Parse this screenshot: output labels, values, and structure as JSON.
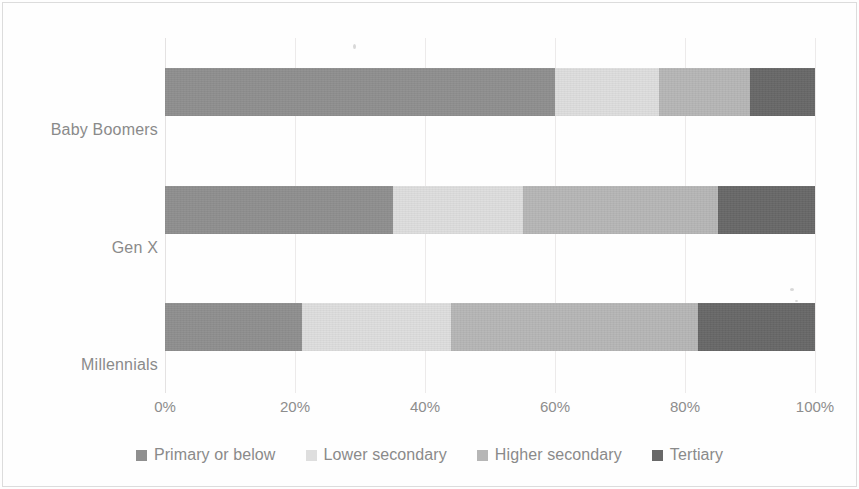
{
  "chart_data": {
    "type": "bar",
    "orientation": "horizontal",
    "stacked": true,
    "normalized_percent": true,
    "title": "",
    "subtitle": "",
    "xlabel": "",
    "ylabel": "",
    "xlim": [
      0,
      100
    ],
    "xticks": [
      0,
      20,
      40,
      60,
      80,
      100
    ],
    "xtick_labels": [
      "0%",
      "20%",
      "40%",
      "60%",
      "80%",
      "100%"
    ],
    "grid": true,
    "grid_axis": "x",
    "legend_position": "bottom",
    "categories": [
      "Millennials",
      "Gen X",
      "Baby Boomers"
    ],
    "categories_top_to_bottom": [
      "Baby Boomers",
      "Gen X",
      "Millennials"
    ],
    "series": [
      {
        "name": "Primary or below",
        "color": "#8f8f8f",
        "values": [
          21,
          35,
          60
        ]
      },
      {
        "name": "Lower secondary",
        "color": "#dedede",
        "values": [
          23,
          20,
          16
        ]
      },
      {
        "name": "Higher secondary",
        "color": "#b6b6b6",
        "values": [
          38,
          30,
          14
        ]
      },
      {
        "name": "Tertiary",
        "color": "#686868",
        "values": [
          18,
          15,
          10
        ]
      }
    ]
  },
  "axis": {
    "ytick_labels": [
      "Baby Boomers",
      "Gen X",
      "Millennials"
    ],
    "xtick_labels": [
      "0%",
      "20%",
      "40%",
      "60%",
      "80%",
      "100%"
    ]
  },
  "legend": {
    "items": [
      {
        "label": "Primary or below",
        "color": "#8f8f8f"
      },
      {
        "label": "Lower secondary",
        "color": "#dedede"
      },
      {
        "label": "Higher secondary",
        "color": "#b6b6b6"
      },
      {
        "label": "Tertiary",
        "color": "#686868"
      }
    ]
  },
  "style": {
    "background": "#fefefe",
    "text_color": "#8a8a8a",
    "grid_color": "#eceaea",
    "frame_color": "#dcdcdc"
  }
}
